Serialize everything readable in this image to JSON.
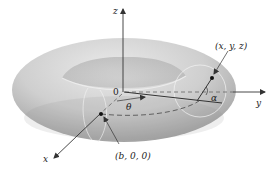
{
  "diagram": {
    "type": "torus-with-axes",
    "colors": {
      "background": "#ffffff",
      "torus_light": "#e2e2e2",
      "torus_mid": "#c4c4c4",
      "torus_dark": "#9a9a9a",
      "axis": "#333333",
      "dashed": "#555555",
      "cross_section": "#eeeeee"
    },
    "axes": {
      "z": {
        "label": "z"
      },
      "y": {
        "label": "y"
      },
      "x": {
        "label": "x"
      }
    },
    "labels": {
      "origin": "0",
      "theta": "θ",
      "alpha": "α",
      "point_xyz": "(x, y, z)",
      "point_b00": "(b, 0, 0)"
    }
  }
}
